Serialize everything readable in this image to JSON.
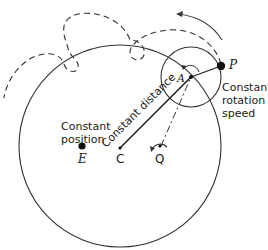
{
  "diagram": {
    "labels": {
      "constant_position_line1": "Constant",
      "constant_position_line2": "position",
      "constant_distance": "Constant distance",
      "constant_rotation_line1": "Constant",
      "constant_rotation_line2": "rotation",
      "constant_rotation_line3": "speed"
    },
    "points": {
      "E": "E",
      "C": "C",
      "Q": "Q",
      "A": "A",
      "P": "P"
    },
    "colors": {
      "stroke": "#333333",
      "text": "#1a1a1a"
    }
  }
}
